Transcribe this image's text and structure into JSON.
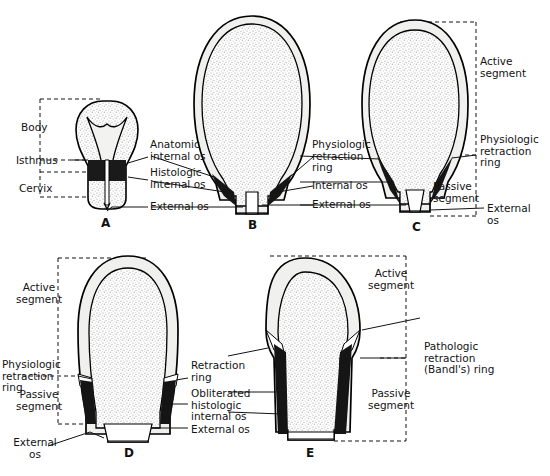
{
  "figure": {
    "panels": [
      {
        "id": "A",
        "letter": "A",
        "caption": "Nonpregnant uterus"
      },
      {
        "id": "B",
        "letter": "B",
        "caption": "Pregnant uterus at term"
      },
      {
        "id": "C",
        "letter": "C",
        "caption": "Early labor"
      },
      {
        "id": "D",
        "letter": "D",
        "caption": "Advanced labor"
      },
      {
        "id": "E",
        "letter": "E",
        "caption": "Obstructed labor"
      }
    ]
  },
  "labels": {
    "body": "Body",
    "isthmus": "Isthmus",
    "cervix": "Cervix",
    "anatomic_internal_os": "Anatomic\ninternal os",
    "histologic_internal_os": "Histologic\ninternal os",
    "external_os": "External os",
    "external_os_wrap": "External\nos",
    "physiologic_retraction_ring": "Physiologic\nretraction\nring",
    "internal_os": "Internal os",
    "active_segment": "Active\nsegment",
    "passive_segment": "Passive\nsegment",
    "retraction_ring": "Retraction\nring",
    "obliterated_histologic_internal_os": "Obliterated\nhistologic\ninternal os",
    "pathologic_retraction_ring": "Pathologic\nretraction\n(Bandl's) ring"
  },
  "colors": {
    "ink": "#131313",
    "outline": "#000000",
    "wall": "#f0f0ee",
    "muscle_dark": "#1a1a1a",
    "stipple": "#d8d8d8",
    "background": "#ffffff"
  }
}
